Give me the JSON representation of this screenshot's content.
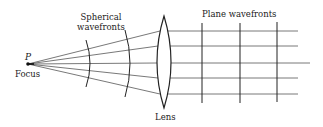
{
  "diagram": {
    "labels": {
      "point": "P",
      "focus": "Focus",
      "spherical": [
        "Spherical",
        "wavefronts"
      ],
      "plane": "Plane wavefronts",
      "lens": "Lens"
    },
    "colors": {
      "line": "#2a2a2a",
      "ray": "#555555",
      "background": "#ffffff"
    },
    "focus_point": {
      "x": 28,
      "y": 64
    },
    "lens": {
      "x": 164,
      "top": 16,
      "bottom": 108,
      "half_width": 7
    },
    "rays_y_at_lens": [
      31,
      46,
      63,
      78,
      94
    ],
    "rays_end_x": [
      298,
      298,
      310,
      298,
      298
    ],
    "spherical_wavefronts_x": [
      89,
      128
    ],
    "plane_wavefronts_x": [
      202,
      240,
      277
    ]
  }
}
